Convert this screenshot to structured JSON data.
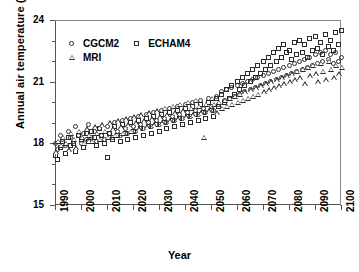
{
  "chart_data": {
    "type": "scatter",
    "title": "",
    "xlabel": "Year",
    "ylabel": "Annual air temperature (°C)",
    "xlim": [
      1990,
      2100
    ],
    "ylim": [
      15,
      24
    ],
    "yticks": [
      15,
      18,
      21,
      24
    ],
    "ytick_labels": [
      "15",
      "18",
      "21",
      "24"
    ],
    "y_minor_ticks": [
      16,
      17,
      19,
      20,
      22,
      23
    ],
    "xticks": [
      1990,
      2000,
      2010,
      2020,
      2030,
      2040,
      2050,
      2060,
      2070,
      2080,
      2090,
      2100
    ],
    "xtick_labels": [
      "1990",
      "2000",
      "2010",
      "2020",
      "2030",
      "2040",
      "2050",
      "2060",
      "2070",
      "2080",
      "2090",
      "2100"
    ],
    "grid": false,
    "legend_position": "top-left",
    "series": [
      {
        "name": "CGCM2",
        "marker": "circle",
        "x": [
          1990,
          1991,
          1992,
          1993,
          1994,
          1995,
          1996,
          1997,
          1998,
          1999,
          2000,
          2001,
          2002,
          2003,
          2004,
          2005,
          2006,
          2007,
          2008,
          2009,
          2010,
          2011,
          2012,
          2013,
          2014,
          2015,
          2016,
          2017,
          2018,
          2019,
          2020,
          2021,
          2022,
          2023,
          2024,
          2025,
          2026,
          2027,
          2028,
          2029,
          2030,
          2031,
          2032,
          2033,
          2034,
          2035,
          2036,
          2037,
          2038,
          2039,
          2040,
          2041,
          2042,
          2043,
          2044,
          2045,
          2046,
          2047,
          2048,
          2049,
          2050,
          2051,
          2052,
          2053,
          2054,
          2055,
          2056,
          2057,
          2058,
          2059,
          2060,
          2061,
          2062,
          2063,
          2064,
          2065,
          2066,
          2067,
          2068,
          2069,
          2070,
          2071,
          2072,
          2073,
          2074,
          2075,
          2076,
          2077,
          2078,
          2079,
          2080,
          2081,
          2082,
          2083,
          2084,
          2085,
          2086,
          2087,
          2088,
          2089,
          2090,
          2091,
          2092,
          2093,
          2094,
          2095,
          2096,
          2097,
          2098,
          2099,
          2100
        ],
        "y": [
          18.0,
          17.7,
          18.4,
          18.2,
          17.9,
          18.6,
          18.3,
          18.1,
          18.8,
          18.4,
          18.0,
          18.5,
          18.2,
          18.9,
          18.3,
          18.6,
          18.1,
          18.7,
          18.4,
          18.2,
          18.8,
          18.5,
          18.3,
          19.0,
          18.6,
          18.4,
          19.1,
          18.7,
          18.5,
          19.2,
          18.8,
          18.6,
          19.3,
          18.9,
          18.7,
          19.4,
          19.0,
          18.8,
          19.5,
          19.1,
          18.9,
          19.6,
          19.2,
          19.0,
          19.7,
          19.3,
          19.1,
          19.8,
          19.4,
          19.2,
          19.9,
          19.5,
          19.3,
          20.0,
          19.6,
          19.4,
          20.1,
          19.7,
          19.5,
          20.2,
          19.8,
          19.6,
          20.3,
          19.9,
          20.5,
          20.1,
          20.6,
          20.2,
          20.7,
          20.3,
          20.8,
          20.4,
          20.9,
          20.5,
          21.0,
          20.6,
          21.1,
          20.7,
          21.2,
          20.8,
          21.3,
          20.9,
          21.4,
          21.0,
          21.5,
          21.1,
          21.6,
          21.2,
          21.7,
          21.3,
          21.8,
          21.4,
          21.9,
          21.5,
          22.0,
          21.6,
          22.1,
          21.7,
          22.2,
          21.8,
          22.3,
          21.9,
          22.4,
          22.0,
          22.5,
          22.1,
          22.3,
          21.9,
          22.4,
          22.0,
          22.2
        ]
      },
      {
        "name": "ECHAM4",
        "marker": "square",
        "x": [
          1990,
          1991,
          1992,
          1993,
          1994,
          1995,
          1996,
          1997,
          1998,
          1999,
          2000,
          2001,
          2002,
          2003,
          2004,
          2005,
          2006,
          2007,
          2008,
          2009,
          2010,
          2011,
          2012,
          2013,
          2014,
          2015,
          2016,
          2017,
          2018,
          2019,
          2020,
          2021,
          2022,
          2023,
          2024,
          2025,
          2026,
          2027,
          2028,
          2029,
          2030,
          2031,
          2032,
          2033,
          2034,
          2035,
          2036,
          2037,
          2038,
          2039,
          2040,
          2041,
          2042,
          2043,
          2044,
          2045,
          2046,
          2047,
          2048,
          2049,
          2050,
          2051,
          2052,
          2053,
          2054,
          2055,
          2056,
          2057,
          2058,
          2059,
          2060,
          2061,
          2062,
          2063,
          2064,
          2065,
          2066,
          2067,
          2068,
          2069,
          2070,
          2071,
          2072,
          2073,
          2074,
          2075,
          2076,
          2077,
          2078,
          2079,
          2080,
          2081,
          2082,
          2083,
          2084,
          2085,
          2086,
          2087,
          2088,
          2089,
          2090,
          2091,
          2092,
          2093,
          2094,
          2095,
          2096,
          2097,
          2098,
          2099,
          2100
        ],
        "y": [
          17.4,
          17.2,
          17.8,
          18.1,
          17.5,
          18.3,
          17.9,
          18.0,
          17.6,
          18.4,
          18.2,
          17.8,
          18.5,
          18.1,
          18.6,
          18.3,
          17.9,
          18.7,
          18.4,
          18.0,
          17.3,
          18.5,
          18.2,
          18.8,
          18.4,
          18.1,
          18.9,
          18.5,
          18.2,
          19.0,
          18.6,
          18.3,
          19.1,
          18.7,
          18.4,
          19.2,
          18.8,
          18.5,
          19.3,
          18.9,
          18.6,
          19.4,
          19.0,
          18.7,
          19.5,
          19.1,
          18.8,
          19.6,
          19.2,
          18.9,
          19.7,
          19.3,
          19.0,
          19.8,
          19.4,
          19.1,
          19.9,
          19.5,
          19.2,
          20.0,
          19.6,
          19.3,
          20.2,
          19.8,
          20.4,
          20.0,
          20.6,
          20.2,
          20.8,
          20.4,
          21.0,
          20.6,
          21.2,
          20.8,
          21.4,
          21.0,
          21.6,
          21.2,
          21.8,
          21.4,
          22.0,
          21.6,
          22.2,
          21.8,
          22.4,
          22.0,
          22.6,
          22.2,
          22.8,
          22.4,
          22.5,
          22.1,
          22.9,
          22.3,
          23.0,
          22.4,
          22.8,
          22.2,
          23.1,
          22.5,
          23.2,
          22.6,
          22.9,
          22.3,
          23.3,
          22.7,
          23.0,
          22.5,
          23.4,
          22.8,
          23.5
        ]
      },
      {
        "name": "MRI",
        "marker": "triangle",
        "x": [
          1990,
          1991,
          1992,
          1993,
          1994,
          1995,
          1996,
          1997,
          1998,
          1999,
          2000,
          2001,
          2002,
          2003,
          2004,
          2005,
          2006,
          2007,
          2008,
          2009,
          2010,
          2011,
          2012,
          2013,
          2014,
          2015,
          2016,
          2017,
          2018,
          2019,
          2020,
          2021,
          2022,
          2023,
          2024,
          2025,
          2026,
          2027,
          2028,
          2029,
          2030,
          2031,
          2032,
          2033,
          2034,
          2035,
          2036,
          2037,
          2038,
          2039,
          2040,
          2041,
          2042,
          2043,
          2044,
          2045,
          2046,
          2047,
          2048,
          2049,
          2050,
          2051,
          2052,
          2053,
          2054,
          2055,
          2056,
          2057,
          2058,
          2059,
          2060,
          2061,
          2062,
          2063,
          2064,
          2065,
          2066,
          2067,
          2068,
          2069,
          2070,
          2071,
          2072,
          2073,
          2074,
          2075,
          2076,
          2077,
          2078,
          2079,
          2080,
          2081,
          2082,
          2083,
          2084,
          2085,
          2086,
          2087,
          2088,
          2089,
          2090,
          2091,
          2092,
          2093,
          2094,
          2095,
          2096,
          2097,
          2098,
          2099,
          2100
        ],
        "y": [
          17.6,
          18.1,
          17.9,
          18.3,
          18.0,
          17.7,
          18.5,
          18.2,
          17.8,
          18.6,
          18.3,
          18.0,
          18.7,
          18.4,
          18.1,
          18.8,
          18.5,
          18.2,
          18.9,
          18.6,
          18.3,
          19.0,
          18.7,
          18.4,
          19.1,
          18.8,
          18.5,
          19.2,
          18.9,
          18.6,
          19.3,
          19.0,
          18.7,
          19.4,
          19.1,
          18.8,
          19.5,
          19.2,
          18.9,
          19.6,
          19.3,
          19.0,
          19.7,
          19.4,
          19.1,
          19.8,
          19.5,
          19.2,
          19.9,
          19.6,
          19.3,
          20.0,
          19.7,
          19.4,
          20.1,
          19.8,
          19.5,
          18.3,
          19.9,
          19.6,
          20.2,
          19.9,
          19.5,
          20.0,
          19.7,
          20.1,
          19.8,
          20.2,
          19.9,
          20.3,
          20.0,
          20.4,
          20.1,
          20.5,
          20.2,
          20.6,
          20.3,
          20.7,
          20.4,
          20.8,
          20.5,
          20.9,
          20.6,
          21.0,
          20.7,
          21.1,
          20.8,
          21.2,
          20.9,
          21.3,
          21.0,
          21.4,
          21.1,
          21.5,
          21.2,
          21.6,
          20.9,
          21.7,
          21.3,
          21.8,
          21.4,
          21.0,
          21.9,
          21.5,
          21.1,
          22.0,
          21.6,
          21.2,
          21.8,
          21.4,
          21.7
        ]
      }
    ]
  }
}
